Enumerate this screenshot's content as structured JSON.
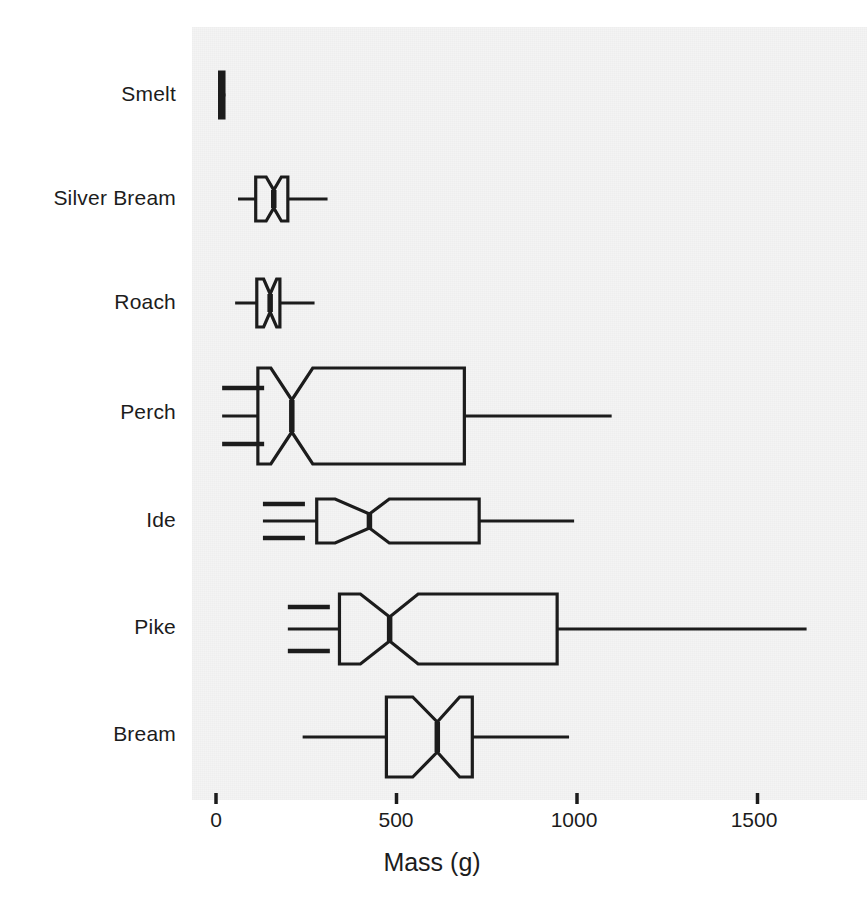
{
  "chart_data": {
    "type": "boxplot",
    "orientation": "horizontal",
    "title": "",
    "subtitle": "",
    "xlabel": "Mass (g)",
    "ylabel": "",
    "xlim": [
      -45,
      1800
    ],
    "xticks": [
      0,
      500,
      1000,
      1500
    ],
    "xtick_labels": [
      "0",
      "500",
      "1000",
      "1500"
    ],
    "grid": false,
    "legend": null,
    "notched": true,
    "panel_background": "#f4f4f4",
    "line_color": "#1c1c1c",
    "box_fill": "none",
    "categories": [
      "Smelt",
      "Silver Bream",
      "Roach",
      "Perch",
      "Ide",
      "Pike",
      "Bream"
    ],
    "boxes": [
      {
        "category": "Smelt",
        "whisker_low": 6,
        "q1": 10,
        "median": 16,
        "q3": 22,
        "whisker_high": 26,
        "notch_low": 12,
        "notch_high": 20
      },
      {
        "category": "Silver Bream",
        "whisker_low": 61,
        "q1": 110,
        "median": 160,
        "q3": 199,
        "whisker_high": 309,
        "notch_low": 139,
        "notch_high": 181
      },
      {
        "category": "Roach",
        "whisker_low": 53,
        "q1": 113,
        "median": 150,
        "q3": 177,
        "whisker_high": 273,
        "notch_low": 132,
        "notch_high": 168
      },
      {
        "category": "Perch",
        "whisker_low": 17,
        "q1": 116,
        "median": 210,
        "q3": 688,
        "whisker_high": 1096,
        "notch_low": 152,
        "notch_high": 268
      },
      {
        "category": "Ide",
        "whisker_low": 130,
        "q1": 279,
        "median": 425,
        "q3": 729,
        "whisker_high": 992,
        "notch_low": 330,
        "notch_high": 480
      },
      {
        "category": "Pike",
        "whisker_low": 199,
        "q1": 342,
        "median": 481,
        "q3": 945,
        "whisker_high": 1636,
        "notch_low": 400,
        "notch_high": 560
      },
      {
        "category": "Bream",
        "whisker_low": 240,
        "q1": 472,
        "median": 613,
        "q3": 710,
        "whisker_high": 978,
        "notch_low": 545,
        "notch_high": 675
      }
    ]
  },
  "axis": {
    "x_title": "Mass (g)",
    "tick_0": "0",
    "tick_500": "500",
    "tick_1000": "1000",
    "tick_1500": "1500"
  },
  "labels": {
    "smelt": "Smelt",
    "silver_bream": "Silver Bream",
    "roach": "Roach",
    "perch": "Perch",
    "ide": "Ide",
    "pike": "Pike",
    "bream": "Bream"
  }
}
